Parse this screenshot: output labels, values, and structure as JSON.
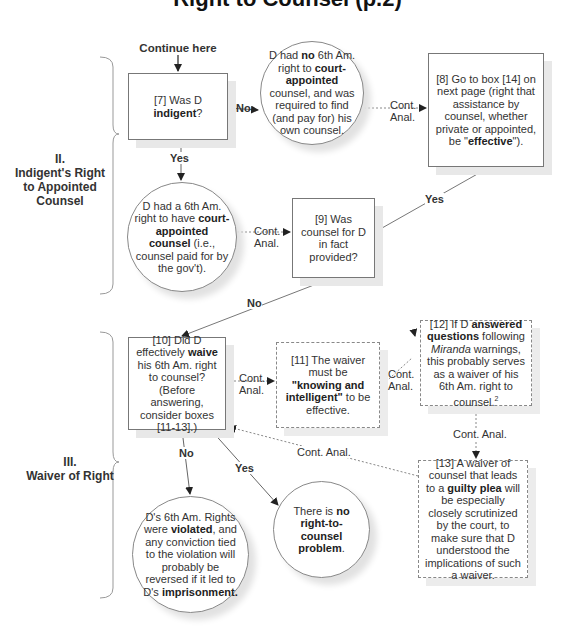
{
  "title": "Right to Counsel (p.2)",
  "start_label": "Continue here",
  "sections": [
    {
      "numeral": "II.",
      "name_lines": [
        "Indigent's Right",
        "to Appointed",
        "Counsel"
      ]
    },
    {
      "numeral": "III.",
      "name_lines": [
        "Waiver of Right"
      ]
    }
  ],
  "nodes": {
    "box7": {
      "parts": [
        "[7] Was D ",
        "indigent",
        "?"
      ]
    },
    "circle_no_right": {
      "parts": [
        "D had ",
        "no",
        " 6th Am. right to ",
        "court-appointed",
        " counsel, and was required to find (and pay for) his own counsel."
      ]
    },
    "box8": {
      "parts": [
        "[8] Go to box [14] on next page (right that assistance by counsel, whether private or appointed, be \"",
        "effective",
        "\")."
      ]
    },
    "circle_right": {
      "parts": [
        "D had a 6th Am. right to have ",
        "court-appointed counsel",
        " (i.e., counsel paid for by the gov't)."
      ]
    },
    "box9": {
      "text": "[9] Was counsel for D in fact provided?"
    },
    "box10": {
      "parts": [
        "[10] Did D effectively ",
        "waive",
        " his 6th Am. right to counsel? (Before answering, consider boxes [11-13].)"
      ]
    },
    "box11": {
      "parts": [
        "[11] The waiver must be ",
        "\"knowing and intelligent\"",
        " to be effective."
      ]
    },
    "box12": {
      "parts": [
        "[12] If D ",
        "answered questions",
        " following ",
        "Miranda",
        " warnings, this probably serves as a waiver of his 6th Am. right to counsel.",
        "2"
      ]
    },
    "box13": {
      "parts": [
        "[13] A waiver of counsel that leads to a ",
        "guilty plea",
        " will be especially closely scrutinized by the court, to make sure that D understood the implications of such a waiver."
      ]
    },
    "circle_violated": {
      "parts": [
        "D's 6th Am. Rights were ",
        "violated",
        ", and any conviction tied to the violation will probably be reversed if it led to D's ",
        "imprisonment."
      ]
    },
    "circle_no_problem": {
      "parts": [
        "There is ",
        "no right-to-counsel problem",
        "."
      ]
    }
  },
  "edges": {
    "yes": "Yes",
    "no": "No",
    "cont_anal_1": "Cont.",
    "cont_anal_2": "Anal.",
    "cont_anal": "Cont. Anal."
  }
}
